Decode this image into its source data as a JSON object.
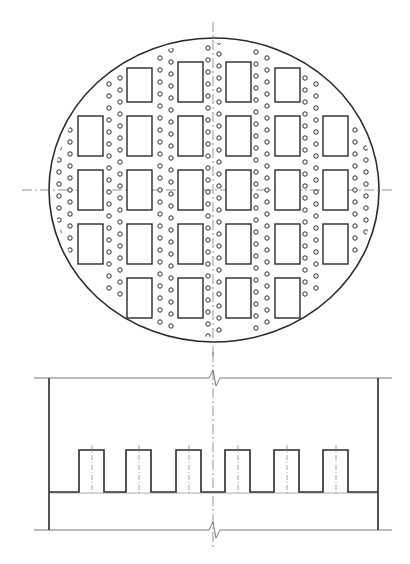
{
  "drawing": {
    "title": "Tray plan view and elevation (bubble cap / perforated tray)",
    "colors": {
      "line": "#2a2a2a",
      "thin": "#555555",
      "center": "#666666",
      "background": "#ffffff"
    },
    "plan_view": {
      "ellipse": {
        "cx": 214,
        "cy": 190,
        "rx": 165,
        "ry": 152
      },
      "centerlines": {
        "vertical_x": 213,
        "vertical_y1": 22,
        "vertical_y2": 358,
        "horizontal_y": 190,
        "horizontal_x1": 22,
        "horizontal_x2": 392
      },
      "rect_size": {
        "w": 25,
        "h": 40
      },
      "rect_columns_x": [
        78,
        127,
        178,
        226,
        275,
        323
      ],
      "rect_rows": [
        {
          "y": 62,
          "cols": [
            1,
            2,
            3,
            4
          ],
          "y_offsets": [
            6,
            0,
            0,
            6
          ]
        },
        {
          "y": 116,
          "cols": [
            0,
            1,
            2,
            3,
            4,
            5
          ]
        },
        {
          "y": 170,
          "cols": [
            0,
            1,
            2,
            3,
            4,
            5
          ]
        },
        {
          "y": 224,
          "cols": [
            0,
            1,
            2,
            3,
            4,
            5
          ]
        },
        {
          "y": 278,
          "cols": [
            1,
            2,
            3,
            4
          ]
        }
      ],
      "hole_radius": 2.2,
      "hole_columns": [
        {
          "x": 59,
          "y_from": 148,
          "y_to": 238,
          "step": 12,
          "offset": 0
        },
        {
          "x": 70,
          "y_from": 130,
          "y_to": 258,
          "step": 12,
          "offset": 6
        },
        {
          "x": 109,
          "y_from": 84,
          "y_to": 296,
          "step": 12,
          "offset": 0
        },
        {
          "x": 120,
          "y_from": 78,
          "y_to": 302,
          "step": 12,
          "offset": 6
        },
        {
          "x": 160,
          "y_from": 58,
          "y_to": 326,
          "step": 12,
          "offset": 0
        },
        {
          "x": 171,
          "y_from": 50,
          "y_to": 332,
          "step": 12,
          "offset": 6
        },
        {
          "x": 208,
          "y_from": 48,
          "y_to": 336,
          "step": 12,
          "offset": 0
        },
        {
          "x": 219,
          "y_from": 42,
          "y_to": 342,
          "step": 12,
          "offset": 6
        },
        {
          "x": 256,
          "y_from": 52,
          "y_to": 330,
          "step": 12,
          "offset": 0
        },
        {
          "x": 267,
          "y_from": 58,
          "y_to": 326,
          "step": 12,
          "offset": 6
        },
        {
          "x": 305,
          "y_from": 78,
          "y_to": 302,
          "step": 12,
          "offset": 0
        },
        {
          "x": 316,
          "y_from": 84,
          "y_to": 296,
          "step": 12,
          "offset": 6
        },
        {
          "x": 355,
          "y_from": 130,
          "y_to": 258,
          "step": 12,
          "offset": 6
        },
        {
          "x": 366,
          "y_from": 148,
          "y_to": 238,
          "step": 12,
          "offset": 0
        }
      ]
    },
    "elevation_view": {
      "top_line_y": 378,
      "bottom_line_y": 530,
      "line_x1": 34,
      "line_x2": 392,
      "left_wall_x": 49,
      "right_wall_x": 378,
      "wall_y1": 378,
      "wall_y2": 530,
      "base_y": 492,
      "tooth_top_y": 450,
      "tooth_width": 25,
      "teeth_x": [
        79,
        126,
        176,
        225,
        274,
        323
      ],
      "break_x": 213,
      "centerline_x": 213,
      "centerline_y1": 352,
      "centerline_y2": 548
    }
  }
}
